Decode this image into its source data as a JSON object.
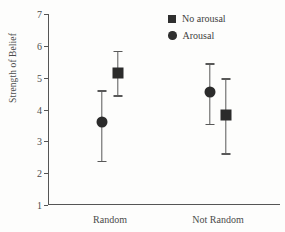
{
  "chart_data": {
    "type": "scatter",
    "title": "",
    "xlabel": "",
    "ylabel": "Strength of Belief",
    "categories": [
      "Random",
      "Not Random"
    ],
    "ylim": [
      1,
      7
    ],
    "yticks": [
      1,
      2,
      3,
      4,
      5,
      6,
      7
    ],
    "ytick_labels": [
      "1",
      "2",
      "3",
      "4",
      "5",
      "6",
      "7"
    ],
    "grid": false,
    "legend_position": "top-right",
    "error_bars": "vertical",
    "series": [
      {
        "name": "No arousal",
        "marker": "square",
        "color": "#2b2b2b",
        "values": [
          5.15,
          3.82
        ],
        "err_low": [
          4.45,
          2.62
        ],
        "err_high": [
          5.85,
          4.98
        ]
      },
      {
        "name": "Arousal",
        "marker": "circle",
        "color": "#2b2b2b",
        "values": [
          3.6,
          4.55
        ],
        "err_low": [
          2.38,
          3.55
        ],
        "err_high": [
          4.6,
          5.45
        ]
      }
    ]
  },
  "legend": {
    "entries": [
      {
        "label": "No arousal",
        "marker": "square-marker-icon"
      },
      {
        "label": "Arousal",
        "marker": "circle-marker-icon"
      }
    ]
  }
}
